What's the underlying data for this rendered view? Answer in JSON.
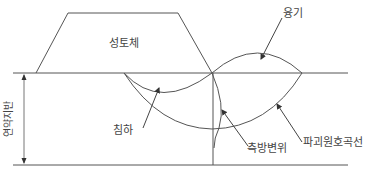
{
  "diagram": {
    "title": "",
    "labels": {
      "embankment": "성토체",
      "heave": "융기",
      "settlement": "침하",
      "lateral_displacement": "측방변위",
      "failure_arc": "파괴원호곡선",
      "soft_ground": "연약지반"
    },
    "colors": {
      "line": "#555555",
      "text": "#444444",
      "background": "#ffffff"
    }
  }
}
